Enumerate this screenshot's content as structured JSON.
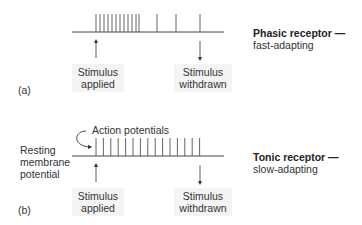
{
  "panel_a": {
    "tag": "(a)",
    "receptor_title": "Phasic receptor —",
    "receptor_subtitle": "fast-adapting",
    "stimulus_applied": [
      "Stimulus",
      "applied"
    ],
    "stimulus_withdrawn": [
      "Stimulus",
      "withdrawn"
    ],
    "spike_x": [
      96,
      100,
      104,
      108,
      112,
      116,
      120,
      124,
      128,
      132,
      136,
      139,
      157,
      176,
      200
    ]
  },
  "panel_b": {
    "tag": "(b)",
    "receptor_title": "Tonic receptor —",
    "receptor_subtitle": "slow-adapting",
    "action_potentials_label": "Action potentials",
    "resting_label": [
      "Resting",
      "membrane",
      "potential"
    ],
    "stimulus_applied": [
      "Stimulus",
      "applied"
    ],
    "stimulus_withdrawn": [
      "Stimulus",
      "withdrawn"
    ],
    "spike_x": [
      96,
      103.4,
      110.8,
      118.2,
      125.6,
      133,
      140.4,
      147.8,
      155.2,
      162.6,
      170,
      177.4,
      184.8,
      192.2,
      199.6
    ]
  },
  "colors": {
    "line": "#444444",
    "spike": "#555555",
    "box_bg": "#f4f4f4"
  }
}
